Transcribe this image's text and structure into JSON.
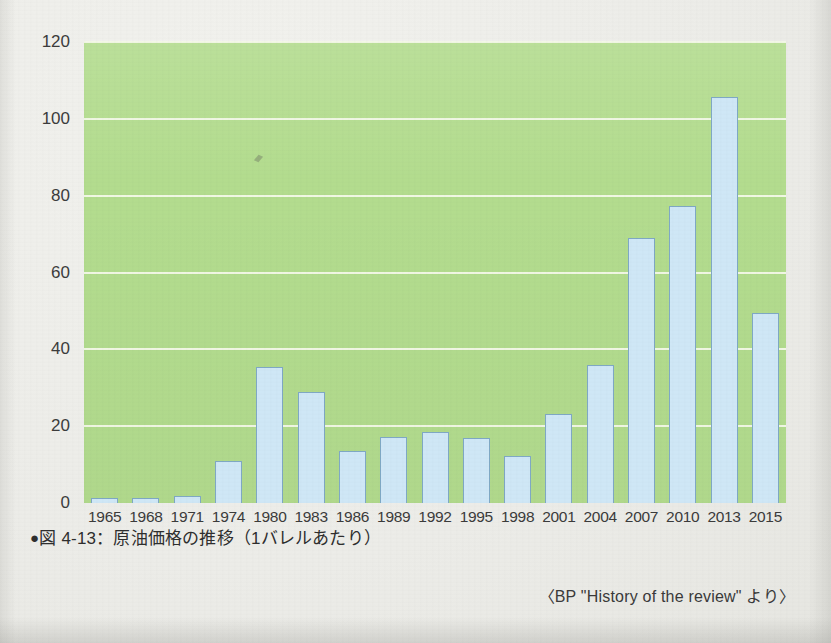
{
  "caption": {
    "bullet": "●",
    "text": "図 4-13：原油価格の推移（1バレルあたり）"
  },
  "source": {
    "text": "〈BP \"History of the review\" より〉"
  },
  "colors": {
    "plot_background": "#b3dc8e",
    "gridline": "#f3f8e8",
    "bar_fill": "#cfe7f6",
    "bar_stroke": "#7fa8c4",
    "page_background": "#ecece8",
    "text": "#3a3a3a"
  },
  "chart_data": {
    "type": "bar",
    "title": "図 4-13：原油価格の推移（1バレルあたり）",
    "subtitle": "",
    "xlabel": "",
    "ylabel": "",
    "ylim": [
      0,
      120
    ],
    "yticks": [
      0,
      20,
      40,
      60,
      80,
      100,
      120
    ],
    "ytick_labels": [
      "0",
      "20",
      "40",
      "60",
      "80",
      "100",
      "120"
    ],
    "grid": true,
    "legend": false,
    "legend_position": "none",
    "source_note": "〈BP \"History of the review\" より〉",
    "categories": [
      "1965",
      "1968",
      "1971",
      "1974",
      "1980",
      "1983",
      "1986",
      "1989",
      "1992",
      "1995",
      "1998",
      "2001",
      "2004",
      "2007",
      "2010",
      "2013",
      "2015"
    ],
    "values": [
      1.42,
      1.32,
      1.7,
      11,
      35.5,
      29,
      13.5,
      17.3,
      18.4,
      16.8,
      12.3,
      23.1,
      36,
      69,
      77.3,
      105.8,
      49.4
    ],
    "data_labels": [
      "1.42",
      "1.32",
      "1.7",
      "11",
      "35.5",
      "29",
      "13.5",
      "17.3",
      "18.4",
      "16.8",
      "12.3",
      "23.1",
      "36",
      "69",
      "77.3",
      "105.8",
      "49.4"
    ]
  }
}
